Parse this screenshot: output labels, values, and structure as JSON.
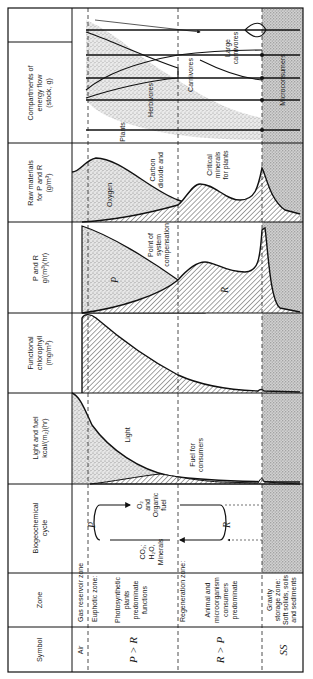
{
  "figure": {
    "orientation": "rotated 90 degrees counter-clockwise",
    "headers": {
      "symbol": "Symbol",
      "zone": "Zone",
      "biogeochemical": [
        "Biogeochemical",
        "cycle"
      ],
      "light_fuel": [
        "Light and fuel",
        "kcal/(m₂)(hr)"
      ],
      "chlorophyll": [
        "Functional",
        "chlorophyll",
        "(mg/m³)"
      ],
      "p_and_r": [
        "P and R",
        "g/(m³)(hr)"
      ],
      "raw_materials": [
        "Raw materials",
        "for P and R",
        "(g/m³)"
      ],
      "compartments": [
        "Compartments of",
        "energy flow",
        "(stock, g)"
      ]
    },
    "zones": [
      {
        "symbol": "Air",
        "name": [
          "Gas reservoir zone"
        ]
      },
      {
        "symbol": "P > R",
        "name": [
          "Euphotic zone:",
          "Photosynthetic",
          "plants",
          "predominate",
          "functions"
        ]
      },
      {
        "symbol": "R > P",
        "name": [
          "Regeneration zone:",
          "Animal and",
          "microorganism",
          "consumers",
          "predominate"
        ]
      },
      {
        "symbol": "SS",
        "name": [
          "Gravity",
          "storage zone:",
          "Soft solids, soils",
          "and sediments"
        ]
      }
    ],
    "cycle": {
      "p": "P",
      "r": "R",
      "top": [
        "O₂",
        "and",
        "Organic",
        "fuel"
      ],
      "bottom": [
        "CO₂;",
        "H₂O,",
        "Minerals"
      ]
    },
    "light_labels": {
      "light": "Light",
      "fuel": [
        "Fuel for",
        "consumers"
      ]
    },
    "pr_labels": {
      "p": "P",
      "r": "R",
      "compensation": [
        "Point of",
        "system",
        "compensation"
      ]
    },
    "raw_labels": {
      "oxygen": "Oxygen",
      "co2": [
        "Carbon",
        "dioxide and"
      ],
      "minerals": [
        "Critical",
        "minerals",
        "for plants"
      ]
    },
    "compartment_labels": {
      "plants": "Plants",
      "herbivores": "Herbivores",
      "carnivores": "Carnivores",
      "large_carnivores": [
        "Large",
        "carnivores"
      ],
      "microconsumers": "Microconsumers"
    },
    "colors": {
      "line": "#111111",
      "stipple": "#c9c9c9",
      "sediment": "#b5b5b5",
      "hatch": "#333333"
    }
  }
}
